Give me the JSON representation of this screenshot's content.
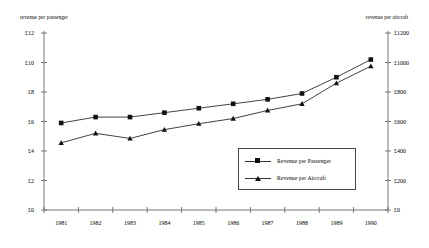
{
  "chart_data": {
    "type": "line",
    "title": "",
    "subtitle": "",
    "xlabel": "",
    "ylabel": "revenue per passenger",
    "y2label": "revenue per aircraft",
    "grid": false,
    "legend_position": "inside-bottom-right",
    "categories": [
      "1981",
      "1982",
      "1983",
      "1984",
      "1985",
      "1986",
      "1987",
      "1988",
      "1989",
      "1990"
    ],
    "ylim": [
      0,
      12
    ],
    "yticks": [
      "£0",
      "£2",
      "£4",
      "£6",
      "£8",
      "£10",
      "£12"
    ],
    "ytick_values": [
      0,
      2,
      4,
      6,
      8,
      10,
      12
    ],
    "y2lim": [
      0,
      1200
    ],
    "y2ticks": [
      "£0",
      "£200",
      "£400",
      "£600",
      "£800",
      "£1000",
      "£1200"
    ],
    "y2tick_values": [
      0,
      200,
      400,
      600,
      800,
      1000,
      1200
    ],
    "series": [
      {
        "name": "Revenue per Passenger",
        "axis": "left",
        "marker": "square",
        "color": "#111111",
        "values": [
          5.9,
          6.3,
          6.3,
          6.6,
          6.9,
          7.2,
          7.5,
          7.9,
          9.0,
          10.2
        ]
      },
      {
        "name": "Revenue per Aircraft",
        "axis": "right",
        "marker": "triangle",
        "color": "#111111",
        "values": [
          455,
          520,
          485,
          545,
          585,
          620,
          675,
          720,
          860,
          975
        ]
      }
    ]
  },
  "legend": {
    "items": [
      {
        "label": "Revenue per Passenger",
        "marker": "square"
      },
      {
        "label": "Revenue per Aircraft",
        "marker": "triangle"
      }
    ]
  },
  "axes": {
    "left_title": "revenue per passenger",
    "right_title": "revenue per aircraft"
  }
}
